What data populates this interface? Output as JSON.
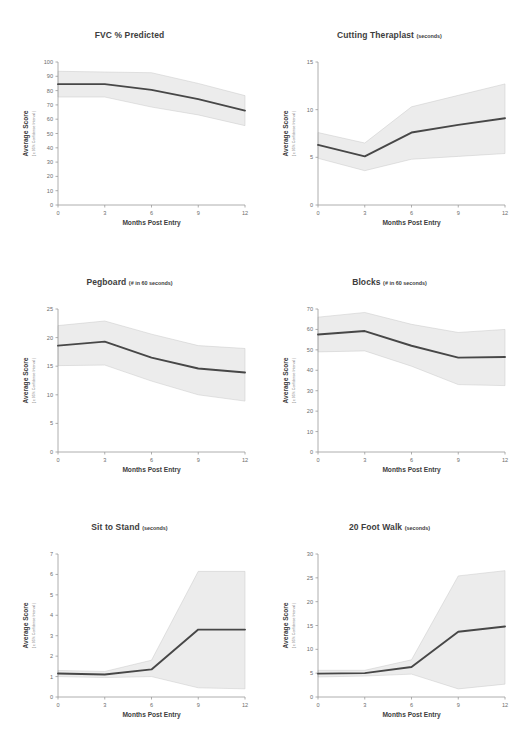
{
  "figure": {
    "background": "#ffffff",
    "band_color": "#ececec",
    "band_edge_color": "#c9c9c9",
    "line_color": "#474747",
    "axis_color": "#9a9a9a",
    "text_color": "#3d3d3d"
  },
  "common": {
    "xlabel": "Months Post Entry",
    "ylabel": "Average Score",
    "ylabel_sub": "( ± 95% Confidence Interval )",
    "x_ticks": [
      0,
      3,
      6,
      9,
      12
    ],
    "x": [
      0,
      3,
      6,
      9,
      12
    ]
  },
  "chart_data": [
    {
      "type": "line",
      "panel": "top-left",
      "title": "FVC % Predicted",
      "units": "",
      "xlabel": "Months Post Entry",
      "ylabel": "Average Score",
      "ylabel_sub": "( ± 95% Confidence Interval )",
      "x": [
        0,
        3,
        6,
        9,
        12
      ],
      "xlim": [
        0,
        12
      ],
      "ylim": [
        0,
        100
      ],
      "y_ticks": [
        0,
        10,
        20,
        30,
        40,
        50,
        60,
        70,
        80,
        90,
        100
      ],
      "grid": false,
      "legend": "none",
      "series": [
        {
          "name": "Mean",
          "values": [
            84.5,
            84.5,
            80.5,
            74.0,
            66.0
          ]
        },
        {
          "name": "Upper 95% CI",
          "values": [
            93.5,
            93.0,
            92.5,
            85.0,
            76.5
          ]
        },
        {
          "name": "Lower 95% CI",
          "values": [
            75.5,
            75.5,
            68.5,
            63.0,
            55.5
          ]
        }
      ]
    },
    {
      "type": "line",
      "panel": "top-right",
      "title": "Cutting Theraplast",
      "units": "(seconds)",
      "xlabel": "Months Post Entry",
      "ylabel": "Average Score",
      "ylabel_sub": "( ± 95% Confidence Interval )",
      "x": [
        0,
        3,
        6,
        9,
        12
      ],
      "xlim": [
        0,
        12
      ],
      "ylim": [
        0,
        15
      ],
      "y_ticks": [
        0,
        5,
        10,
        15
      ],
      "grid": false,
      "legend": "none",
      "series": [
        {
          "name": "Mean",
          "values": [
            6.3,
            5.1,
            7.6,
            8.4,
            9.1
          ]
        },
        {
          "name": "Upper 95% CI",
          "values": [
            7.6,
            6.5,
            10.3,
            11.5,
            12.7
          ]
        },
        {
          "name": "Lower 95% CI",
          "values": [
            4.9,
            3.6,
            4.8,
            5.1,
            5.4
          ]
        }
      ]
    },
    {
      "type": "line",
      "panel": "middle-left",
      "title": "Pegboard",
      "units": "(# in 60 seconds)",
      "xlabel": "Months Post Entry",
      "ylabel": "Average Score",
      "ylabel_sub": "( ± 95% Confidence Interval )",
      "x": [
        0,
        3,
        6,
        9,
        12
      ],
      "xlim": [
        0,
        12
      ],
      "ylim": [
        0,
        25
      ],
      "y_ticks": [
        0,
        5,
        10,
        15,
        20,
        25
      ],
      "grid": false,
      "legend": "none",
      "series": [
        {
          "name": "Mean",
          "values": [
            18.6,
            19.3,
            16.5,
            14.6,
            13.9
          ]
        },
        {
          "name": "Upper 95% CI",
          "values": [
            22.1,
            22.9,
            20.6,
            18.6,
            18.1
          ]
        },
        {
          "name": "Lower 95% CI",
          "values": [
            15.1,
            15.2,
            12.4,
            10.0,
            8.9
          ]
        }
      ]
    },
    {
      "type": "line",
      "panel": "middle-right",
      "title": "Blocks",
      "units": "(# in 60 seconds)",
      "xlabel": "Months Post Entry",
      "ylabel": "Average Score",
      "ylabel_sub": "( ± 95% Confidence Interval )",
      "x": [
        0,
        3,
        6,
        9,
        12
      ],
      "xlim": [
        0,
        12
      ],
      "ylim": [
        0,
        70
      ],
      "y_ticks": [
        0,
        10,
        20,
        30,
        40,
        50,
        60,
        70
      ],
      "grid": false,
      "legend": "none",
      "series": [
        {
          "name": "Mean",
          "values": [
            57.5,
            59.2,
            52.0,
            46.2,
            46.5
          ]
        },
        {
          "name": "Upper 95% CI",
          "values": [
            66.0,
            68.3,
            62.5,
            58.5,
            60.0
          ]
        },
        {
          "name": "Lower 95% CI",
          "values": [
            49.0,
            49.5,
            42.0,
            33.0,
            32.5
          ]
        }
      ]
    },
    {
      "type": "line",
      "panel": "bottom-left",
      "title": "Sit to Stand",
      "units": "(seconds)",
      "xlabel": "Months Post Entry",
      "ylabel": "Average Score",
      "ylabel_sub": "( ± 95% Confidence Interval )",
      "x": [
        0,
        3,
        6,
        9,
        12
      ],
      "xlim": [
        0,
        12
      ],
      "ylim": [
        0,
        7
      ],
      "y_ticks": [
        0,
        1,
        2,
        3,
        4,
        5,
        6,
        7
      ],
      "grid": false,
      "legend": "none",
      "series": [
        {
          "name": "Mean",
          "values": [
            1.15,
            1.1,
            1.35,
            3.3,
            3.3
          ]
        },
        {
          "name": "Upper 95% CI",
          "values": [
            1.3,
            1.25,
            1.8,
            6.15,
            6.15
          ]
        },
        {
          "name": "Lower 95% CI",
          "values": [
            1.0,
            0.95,
            1.0,
            0.45,
            0.4
          ]
        }
      ]
    },
    {
      "type": "line",
      "panel": "bottom-right",
      "title": "20 Foot Walk",
      "units": "(seconds)",
      "xlabel": "Months Post Entry",
      "ylabel": "Average Score",
      "ylabel_sub": "( ± 95% Confidence Interval )",
      "x": [
        0,
        3,
        6,
        9,
        12
      ],
      "xlim": [
        0,
        12
      ],
      "ylim": [
        0,
        30
      ],
      "y_ticks": [
        0,
        5,
        10,
        15,
        20,
        25,
        30
      ],
      "grid": false,
      "legend": "none",
      "series": [
        {
          "name": "Mean",
          "values": [
            4.9,
            5.0,
            6.3,
            13.7,
            14.8
          ]
        },
        {
          "name": "Upper 95% CI",
          "values": [
            5.6,
            5.6,
            7.8,
            25.4,
            26.5
          ]
        },
        {
          "name": "Lower 95% CI",
          "values": [
            4.2,
            4.4,
            4.8,
            1.7,
            2.7
          ]
        }
      ]
    }
  ]
}
